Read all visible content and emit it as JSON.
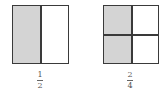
{
  "diagrams": [
    {
      "label": "one-half",
      "fraction": {
        "numerator": "1",
        "denominator": "2"
      },
      "grid": {
        "cols": 2,
        "rows": 1,
        "shaded_cells": [
          [
            0,
            0
          ]
        ]
      }
    },
    {
      "label": "two-fourths",
      "fraction": {
        "numerator": "2",
        "denominator": "4"
      },
      "grid": {
        "cols": 2,
        "rows": 2,
        "shaded_cells": [
          [
            0,
            0
          ],
          [
            1,
            0
          ]
        ]
      }
    }
  ],
  "colors": {
    "border": "#3a3a3a",
    "shade": "#d4d4d4",
    "background": "#ffffff"
  }
}
